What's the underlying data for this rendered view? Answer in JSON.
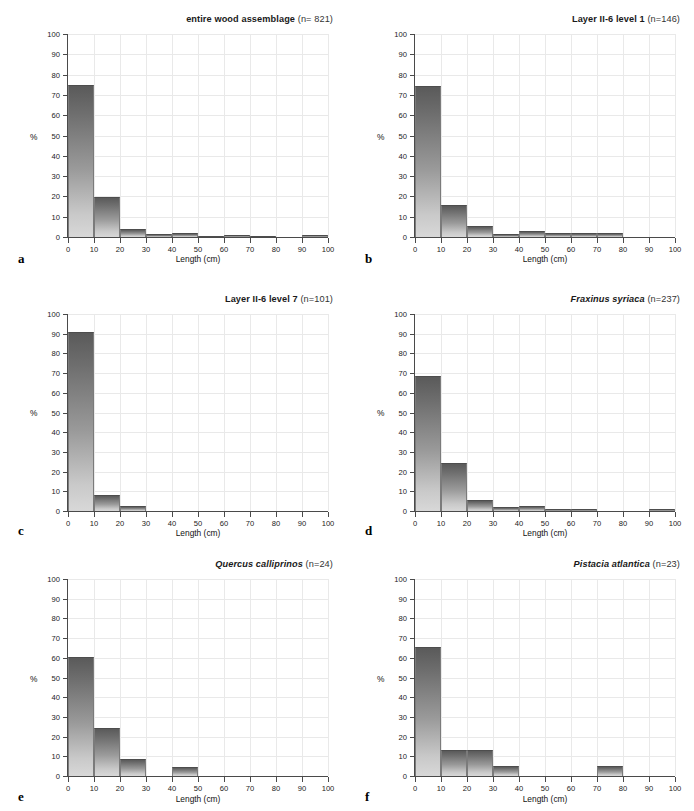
{
  "figure": {
    "axis_titles": {
      "x": "Length (cm)",
      "y": "%"
    },
    "x_ticks": [
      "0",
      "10",
      "20",
      "30",
      "40",
      "50",
      "60",
      "70",
      "80",
      "90",
      "100"
    ],
    "y_ticks": [
      "0",
      "10",
      "20",
      "30",
      "40",
      "50",
      "60",
      "70",
      "80",
      "90",
      "100"
    ],
    "bar_gradient_top": "#5a5a5a",
    "bar_gradient_bottom": "#d8d8d8",
    "axis_color": "#4a4a4a",
    "grid_color": "#e9e9e9"
  },
  "panels": [
    {
      "letter": "a",
      "title_main": "entire wood assemblage",
      "title_n": "(n= 821)",
      "italic": false
    },
    {
      "letter": "b",
      "title_main": "Layer II-6 level 1",
      "title_n": "(n=146)",
      "italic": false
    },
    {
      "letter": "c",
      "title_main": "Layer II-6 level 7",
      "title_n": "(n=101)",
      "italic": false
    },
    {
      "letter": "d",
      "title_main": "Fraxinus syriaca",
      "title_n": "(n=237)",
      "italic": true
    },
    {
      "letter": "e",
      "title_main": "Quercus calliprinos",
      "title_n": "(n=24)",
      "italic": true
    },
    {
      "letter": "f",
      "title_main": "Pistacia atlantica",
      "title_n": "(n=23)",
      "italic": true
    }
  ],
  "chart_data": [
    {
      "type": "bar",
      "panel": "a",
      "title": "entire wood assemblage (n= 821)",
      "xlabel": "Length (cm)",
      "ylabel": "%",
      "xlim": [
        0,
        100
      ],
      "ylim": [
        0,
        100
      ],
      "grid": true,
      "bin_width": 10,
      "categories": [
        "0-10",
        "10-20",
        "20-30",
        "30-40",
        "40-50",
        "50-60",
        "60-70",
        "70-80",
        "80-90",
        "90-100"
      ],
      "values": [
        74.3,
        19.3,
        3.8,
        1.0,
        1.7,
        0.2,
        0.4,
        0.2,
        0.0,
        0.4
      ]
    },
    {
      "type": "bar",
      "panel": "b",
      "title": "Layer II-6 level 1 (n=146)",
      "xlabel": "Length (cm)",
      "ylabel": "%",
      "xlim": [
        0,
        100
      ],
      "ylim": [
        0,
        100
      ],
      "grid": true,
      "bin_width": 10,
      "categories": [
        "0-10",
        "10-20",
        "20-30",
        "30-40",
        "40-50",
        "50-60",
        "60-70",
        "70-80",
        "80-90",
        "90-100"
      ],
      "values": [
        73.9,
        15.2,
        5.1,
        1.0,
        2.5,
        1.4,
        1.4,
        1.4,
        0.0,
        0.0
      ]
    },
    {
      "type": "bar",
      "panel": "c",
      "title": "Layer II-6 level 7 (n=101)",
      "xlabel": "Length (cm)",
      "ylabel": "%",
      "xlim": [
        0,
        100
      ],
      "ylim": [
        0,
        100
      ],
      "grid": true,
      "bin_width": 10,
      "categories": [
        "0-10",
        "10-20",
        "20-30",
        "30-40",
        "40-50",
        "50-60",
        "60-70",
        "70-80",
        "80-90",
        "90-100"
      ],
      "values": [
        90.3,
        7.9,
        1.9,
        0.0,
        0.0,
        0.0,
        0.0,
        0.0,
        0.0,
        0.0
      ]
    },
    {
      "type": "bar",
      "panel": "d",
      "title": "Fraxinus syriaca (n=237)",
      "xlabel": "Length (cm)",
      "ylabel": "%",
      "xlim": [
        0,
        100
      ],
      "ylim": [
        0,
        100
      ],
      "grid": true,
      "bin_width": 10,
      "categories": [
        "0-10",
        "10-20",
        "20-30",
        "30-40",
        "40-50",
        "50-60",
        "60-70",
        "70-80",
        "80-90",
        "90-100"
      ],
      "values": [
        67.9,
        24.1,
        5.1,
        1.5,
        2.1,
        0.5,
        0.4,
        0.0,
        0.0,
        0.8
      ]
    },
    {
      "type": "bar",
      "panel": "e",
      "title": "Quercus calliprinos (n=24)",
      "xlabel": "Length (cm)",
      "ylabel": "%",
      "xlim": [
        0,
        100
      ],
      "ylim": [
        0,
        100
      ],
      "grid": true,
      "bin_width": 10,
      "categories": [
        "0-10",
        "10-20",
        "20-30",
        "30-40",
        "40-50",
        "50-60",
        "60-70",
        "70-80",
        "80-90",
        "90-100"
      ],
      "values": [
        60.0,
        24.2,
        8.2,
        0.0,
        4.1,
        0.0,
        0.0,
        0.0,
        0.0,
        0.0
      ]
    },
    {
      "type": "bar",
      "panel": "f",
      "title": "Pistacia atlantica (n=23)",
      "xlabel": "Length (cm)",
      "ylabel": "%",
      "xlim": [
        0,
        100
      ],
      "ylim": [
        0,
        100
      ],
      "grid": true,
      "bin_width": 10,
      "categories": [
        "0-10",
        "10-20",
        "20-30",
        "30-40",
        "40-50",
        "50-60",
        "60-70",
        "70-80",
        "80-90",
        "90-100"
      ],
      "values": [
        65.2,
        13.0,
        13.0,
        4.5,
        0.0,
        0.0,
        0.0,
        4.5,
        0.0,
        0.0
      ]
    }
  ]
}
